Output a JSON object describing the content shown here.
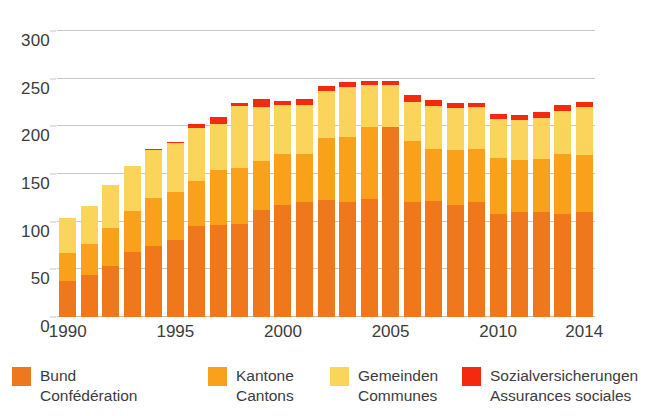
{
  "chart_data": {
    "type": "bar",
    "subtype": "stacked",
    "title": "",
    "xlabel": "",
    "ylabel": "",
    "ylim": [
      0,
      300
    ],
    "yticks": [
      0,
      50,
      100,
      150,
      200,
      250,
      300
    ],
    "xticks": [
      "1990",
      "1995",
      "2000",
      "2005",
      "2010",
      "2014"
    ],
    "grid": true,
    "legend_position": "bottom",
    "categories": [
      "1990",
      "1991",
      "1992",
      "1993",
      "1994",
      "1995",
      "1996",
      "1997",
      "1998",
      "1999",
      "2000",
      "2001",
      "2002",
      "2003",
      "2004",
      "2005",
      "2006",
      "2007",
      "2008",
      "2009",
      "2010",
      "2011",
      "2012",
      "2013",
      "2014"
    ],
    "series": [
      {
        "name": "Bund",
        "name_fr": "Confédération",
        "color": "#F0781C",
        "values": [
          38,
          44,
          54,
          68,
          74,
          81,
          95,
          96,
          98,
          112,
          118,
          121,
          123,
          121,
          124,
          199,
          121,
          122,
          118,
          121,
          108,
          110,
          110,
          108,
          110
        ]
      },
      {
        "name": "Kantone",
        "name_fr": "Cantons",
        "color": "#F9A11B",
        "values": [
          29,
          33,
          39,
          43,
          51,
          50,
          48,
          58,
          58,
          52,
          53,
          50,
          65,
          68,
          75,
          0,
          64,
          54,
          57,
          55,
          59,
          55,
          56,
          63,
          60
        ]
      },
      {
        "name": "Gemeinden",
        "name_fr": "Communes",
        "color": "#FBD45B",
        "values": [
          37,
          39,
          45,
          47,
          50,
          52,
          55,
          48,
          65,
          56,
          51,
          51,
          49,
          52,
          44,
          44,
          41,
          45,
          44,
          44,
          41,
          42,
          43,
          45,
          50
        ]
      },
      {
        "name": "Sozialversicherungen",
        "name_fr": "Assurances sociales",
        "color": "#F42A10",
        "values": [
          0,
          0,
          0,
          0,
          1,
          1,
          5,
          8,
          4,
          9,
          5,
          7,
          5,
          6,
          5,
          5,
          7,
          7,
          5,
          5,
          5,
          5,
          6,
          6,
          6
        ]
      }
    ],
    "totals": [
      104,
      116,
      138,
      158,
      176,
      184,
      203,
      210,
      225,
      229,
      227,
      229,
      242,
      247,
      248,
      248,
      233,
      228,
      224,
      225,
      213,
      212,
      215,
      222,
      226
    ]
  },
  "legend": {
    "items": [
      {
        "de": "Bund",
        "fr": "Confédération",
        "color": "#F0781C"
      },
      {
        "de": "Kantone",
        "fr": "Cantons",
        "color": "#F9A11B"
      },
      {
        "de": "Gemeinden",
        "fr": "Communes",
        "color": "#FBD45B"
      },
      {
        "de": "Sozialversicherungen",
        "fr": "Assurances sociales",
        "color": "#F42A10"
      }
    ]
  }
}
